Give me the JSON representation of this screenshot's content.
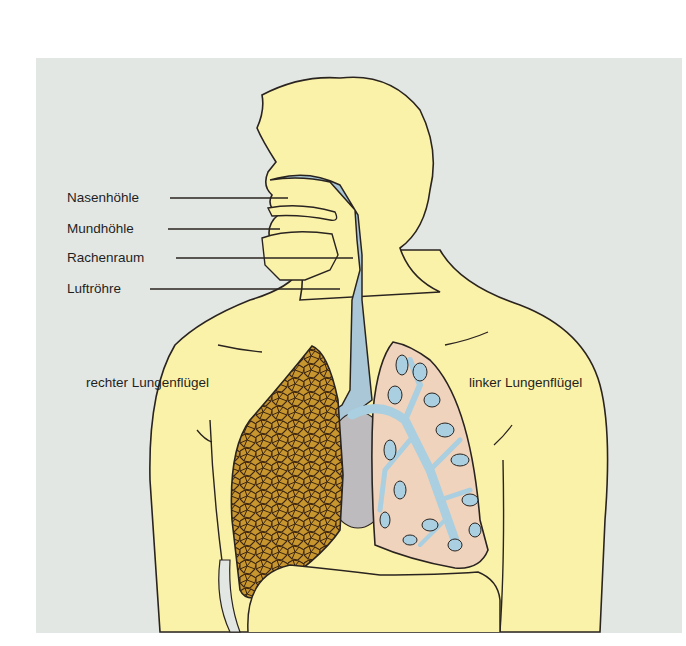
{
  "figure": {
    "labels": {
      "nasenhoehle": "Nasenhöhle",
      "mundhoehle": "Mundhöhle",
      "rachenraum": "Rachenraum",
      "luftroehre": "Luftröhre",
      "rechter_lungenfluegel": "rechter Lungenflügel",
      "linker_lungenfluegel": "linker Lungenflügel"
    },
    "colors": {
      "background": "#e3e7e4",
      "skin": "#fbf2a9",
      "airway": "#a9c7d6",
      "right_lung": "#c8962e",
      "left_lung": "#efd3bd",
      "bronchi": "#a9cfe0",
      "heart": "#bdbbbd",
      "outline": "#2a2420"
    }
  }
}
